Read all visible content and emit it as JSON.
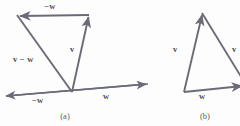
{
  "figure": {
    "background_color": "#fdfdfd",
    "stroke_color": "#6b6b78",
    "label_color": "#4a4a55",
    "caption_color": "#5a5a63"
  },
  "panels": [
    {
      "id": "a",
      "caption": "(a)",
      "caption_pos": {
        "x": 65,
        "y": 118
      },
      "axis": {
        "name": "horizontal-axis",
        "from": {
          "x": 2,
          "y": 96
        },
        "to": {
          "x": 148,
          "y": 84
        },
        "arrow_start": true,
        "arrow_end": true
      },
      "labels": [
        {
          "id": "top-minus-w",
          "text": "−w",
          "x": 50,
          "y": 9
        },
        {
          "id": "left-v-minus-w",
          "text": "v − w",
          "x": 13,
          "y": 62
        },
        {
          "id": "right-v",
          "text": "v",
          "x": 70,
          "y": 52
        },
        {
          "id": "axis-minus-w",
          "text": "−w",
          "x": 32,
          "y": 103
        },
        {
          "id": "axis-w",
          "text": "w",
          "x": 103,
          "y": 99
        }
      ],
      "vectors": [
        {
          "id": "v",
          "label": "v",
          "from": {
            "x": 72,
            "y": 92
          },
          "to": {
            "x": 88,
            "y": 15
          },
          "arrow_end": true
        },
        {
          "id": "minus-w",
          "label": "−w",
          "from": {
            "x": 88,
            "y": 15
          },
          "to": {
            "x": 17,
            "y": 15
          },
          "arrow_end": true
        },
        {
          "id": "v-minus-w",
          "label": "v − w",
          "from": {
            "x": 17,
            "y": 15
          },
          "to": {
            "x": 72,
            "y": 92
          },
          "arrow_end": false
        }
      ]
    },
    {
      "id": "b",
      "caption": "(b)",
      "caption_pos": {
        "x": 205,
        "y": 118
      },
      "labels": [
        {
          "id": "left-v",
          "text": "v",
          "x": 173,
          "y": 52
        },
        {
          "id": "bottom-w",
          "text": "w",
          "x": 199,
          "y": 99
        },
        {
          "id": "diag-v-minus-w",
          "text": "v",
          "x": 232,
          "y": 52
        }
      ],
      "vectors": [
        {
          "id": "v",
          "label": "v",
          "from": {
            "x": 184,
            "y": 92
          },
          "to": {
            "x": 202,
            "y": 13
          },
          "arrow_end": true
        },
        {
          "id": "w",
          "label": "w",
          "from": {
            "x": 184,
            "y": 92
          },
          "to": {
            "x": 246,
            "y": 86
          },
          "arrow_end": true
        },
        {
          "id": "v-minus-w",
          "label": "v − w",
          "from": {
            "x": 202,
            "y": 13
          },
          "to": {
            "x": 248,
            "y": 88
          },
          "arrow_end": false
        }
      ]
    }
  ]
}
